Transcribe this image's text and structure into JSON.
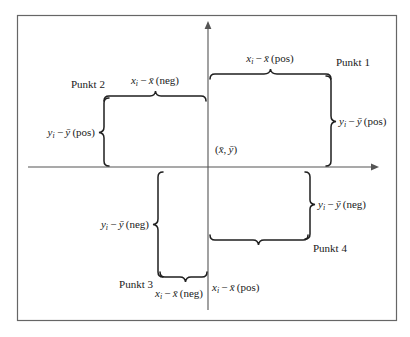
{
  "figure": {
    "border_color": "#555555",
    "axis_color": "#4a4a4a",
    "brace_color": "#1f1f1f",
    "background": "#ffffff",
    "axes": {
      "x_axis_name": "horizontal-axis",
      "y_axis_name": "vertical-axis",
      "origin_label": "(x̄, ȳ)",
      "origin_label_parts": {
        "open": "(",
        "x_bar": "x̄",
        "comma": ",",
        "y_bar": "ȳ",
        "close": ")"
      }
    },
    "points": [
      {
        "id": "punkt-1",
        "label": "Punkt 1",
        "quadrant": 1,
        "x_brace_label": "xᵢ − x̄ (pos)",
        "y_brace_label": "yᵢ − ȳ (pos)",
        "x_sign": "pos",
        "y_sign": "pos"
      },
      {
        "id": "punkt-2",
        "label": "Punkt 2",
        "quadrant": 2,
        "x_brace_label": "xᵢ − x̄ (neg)",
        "y_brace_label": "yᵢ − ȳ (pos)",
        "x_sign": "neg",
        "y_sign": "pos"
      },
      {
        "id": "punkt-3",
        "label": "Punkt 3",
        "quadrant": 3,
        "x_brace_label": "xᵢ − x̄ (neg)",
        "y_brace_label": "yᵢ − ȳ (neg)",
        "x_sign": "neg",
        "y_sign": "neg"
      },
      {
        "id": "punkt-4",
        "label": "Punkt 4",
        "quadrant": 4,
        "x_brace_label": "xᵢ − x̄ (pos)",
        "y_brace_label": "yᵢ − ȳ (neg)",
        "x_sign": "pos",
        "y_sign": "neg"
      }
    ],
    "labels": {
      "punkt1": "Punkt 1",
      "punkt2": "Punkt 2",
      "punkt3": "Punkt 3",
      "punkt4": "Punkt 4",
      "x_pos_top": "(pos)",
      "x_neg_top": "(neg)",
      "x_neg_bottom": "(neg)",
      "x_pos_bottom": "(pos)",
      "y_pos_left": "(pos)",
      "y_pos_right": "(pos)",
      "y_neg_left": "(neg)",
      "y_neg_right": "(neg)"
    }
  }
}
